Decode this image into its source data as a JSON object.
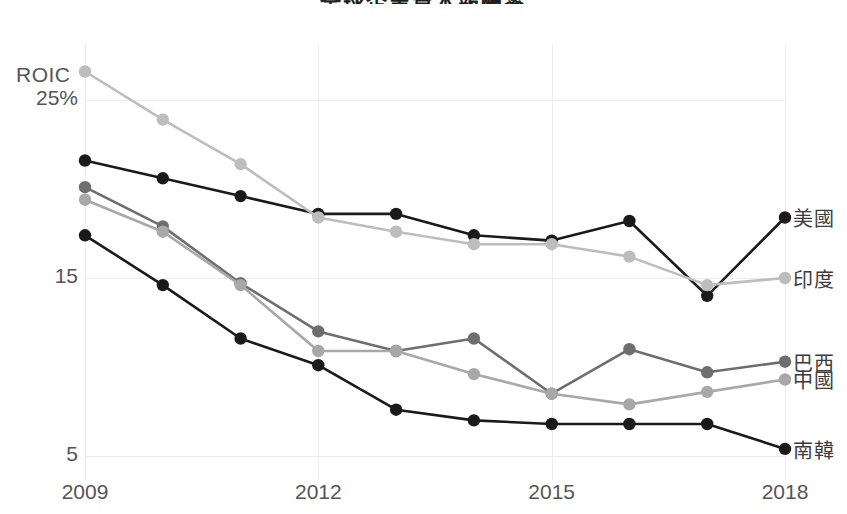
{
  "title": "全球企業資本報酬率",
  "axes": {
    "y_label": "ROIC",
    "y_ticks": [
      {
        "label": "25%",
        "value": 25
      },
      {
        "label": "15",
        "value": 15
      },
      {
        "label": "5",
        "value": 5
      }
    ],
    "x_ticks": [
      {
        "label": "2009",
        "value": 2009
      },
      {
        "label": "2012",
        "value": 2012
      },
      {
        "label": "2015",
        "value": 2015
      },
      {
        "label": "2018",
        "value": 2018
      }
    ]
  },
  "legend": {
    "items": [
      {
        "name": "usa",
        "label": "美國",
        "color": "#1a1a1a"
      },
      {
        "name": "india",
        "label": "印度",
        "color": "#bdbdbd"
      },
      {
        "name": "brazil",
        "label": "巴西",
        "color": "#6e6e6e"
      },
      {
        "name": "china",
        "label": "中國",
        "color": "#a8a8a8"
      },
      {
        "name": "south-korea",
        "label": "南韓",
        "color": "#1a1a1a"
      }
    ]
  },
  "chart_data": {
    "type": "line",
    "title": "全球企業資本報酬率",
    "xlabel": "",
    "ylabel": "ROIC",
    "ylim": [
      3,
      27
    ],
    "xlim": [
      2009,
      2018
    ],
    "grid": true,
    "legend_position": "right",
    "x": [
      2009,
      2010,
      2011,
      2012,
      2013,
      2014,
      2015,
      2016,
      2017,
      2018
    ],
    "series": [
      {
        "name": "美國",
        "key": "usa",
        "color": "#1a1a1a",
        "values": [
          21.6,
          20.6,
          19.6,
          18.6,
          18.6,
          17.4,
          17.1,
          18.2,
          14.0,
          18.4
        ]
      },
      {
        "name": "印度",
        "key": "india",
        "color": "#bdbdbd",
        "values": [
          26.6,
          23.9,
          21.4,
          18.4,
          17.6,
          16.9,
          16.9,
          16.2,
          14.6,
          15.0
        ]
      },
      {
        "name": "巴西",
        "key": "brazil",
        "color": "#6e6e6e",
        "values": [
          20.1,
          17.9,
          14.7,
          12.0,
          10.9,
          11.6,
          8.5,
          11.0,
          9.7,
          10.3
        ]
      },
      {
        "name": "中國",
        "key": "china",
        "color": "#a8a8a8",
        "values": [
          19.4,
          17.6,
          14.6,
          10.9,
          10.9,
          9.6,
          8.5,
          7.9,
          8.6,
          9.3
        ]
      },
      {
        "name": "南韓",
        "key": "south-korea",
        "color": "#1a1a1a",
        "values": [
          17.4,
          14.6,
          11.6,
          10.1,
          7.6,
          7.0,
          6.8,
          6.8,
          6.8,
          5.4
        ]
      }
    ]
  }
}
